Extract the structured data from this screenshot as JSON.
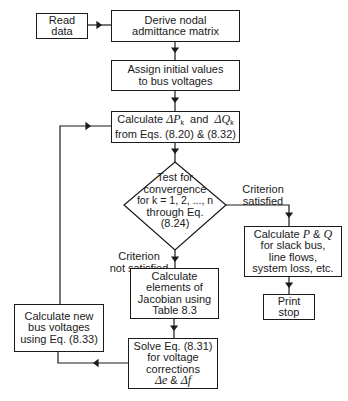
{
  "diagram": {
    "type": "flowchart",
    "nodes": {
      "read_data": {
        "lines": [
          "Read",
          "data"
        ]
      },
      "derive_admittance": {
        "lines": [
          "Derive  nodal",
          "admittance matrix"
        ]
      },
      "assign_initial": {
        "lines": [
          "Assign initial values",
          "to bus voltages"
        ]
      },
      "calc_mismatch": {
        "line1_a": "Calculate ",
        "dp": "ΔP",
        "dp_sub": "k",
        "line1_b": "  and  ",
        "dq": "ΔQ",
        "dq_sub": "k",
        "line2": "from Eqs. (8.20) & (8.32)"
      },
      "test_convergence": {
        "lines": [
          "Test for",
          "convergence",
          "for k = 1, 2, ..., n",
          "through Eq.",
          "(8.24)"
        ]
      },
      "calc_pq": {
        "line1_a": "Calculate ",
        "p": "P",
        "amp": " & ",
        "q": "Q",
        "lines": [
          "for slack bus,",
          "line flows,",
          "system loss, etc."
        ]
      },
      "print_stop": {
        "lines": [
          "Print",
          "stop"
        ]
      },
      "calc_jacobian": {
        "lines": [
          "Calculate",
          "elements of",
          "Jacobian using",
          "Table 8.3"
        ]
      },
      "solve_corrections": {
        "lines": [
          "Solve Eq. (8.31)",
          "for voltage",
          "corrections"
        ],
        "de": "Δe",
        "amp": " & ",
        "df": "Δf"
      },
      "calc_new_voltages": {
        "lines": [
          "Calculate new",
          "bus voltages",
          "using Eq. (8.33)"
        ]
      }
    },
    "edge_labels": {
      "satisfied": [
        "Criterion",
        "satisfied"
      ],
      "not_satisfied": [
        "Criterion",
        "not satisfied"
      ]
    }
  }
}
